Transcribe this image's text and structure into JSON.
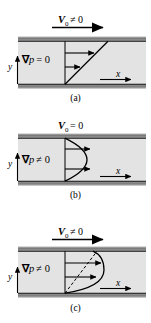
{
  "figure": {
    "colors": {
      "wall": "#8a8a8a",
      "wall_dark": "#6e6e6e",
      "fluid": "#e3e3e3",
      "line": "#000000",
      "background": "#ffffff"
    }
  },
  "panels": [
    {
      "id": "a",
      "caption": "(a)",
      "wall_velocity_label": "V",
      "wall_velocity_sub": "0",
      "wall_velocity_rel": "≠ 0",
      "has_top_arrow": true,
      "pressure_grad_symbol": "∇",
      "pressure_grad_var": "p",
      "pressure_grad_rel": "= 0",
      "axis_y": "y",
      "axis_x": "x",
      "profile_type": "linear",
      "arrow_count": 2,
      "has_dashed_line": false
    },
    {
      "id": "b",
      "caption": "(b)",
      "wall_velocity_label": "V",
      "wall_velocity_sub": "0",
      "wall_velocity_rel": "= 0",
      "has_top_arrow": false,
      "pressure_grad_symbol": "∇",
      "pressure_grad_var": "p",
      "pressure_grad_rel": "≠ 0",
      "axis_y": "y",
      "axis_x": "x",
      "profile_type": "parabolic",
      "arrow_count": 2,
      "has_dashed_line": false
    },
    {
      "id": "c",
      "caption": "(c)",
      "wall_velocity_label": "V",
      "wall_velocity_sub": "0",
      "wall_velocity_rel": "≠ 0",
      "has_top_arrow": true,
      "pressure_grad_symbol": "∇",
      "pressure_grad_var": "p",
      "pressure_grad_rel": "≠ 0",
      "axis_y": "y",
      "axis_x": "x",
      "profile_type": "combined",
      "arrow_count": 2,
      "has_dashed_line": true
    }
  ]
}
